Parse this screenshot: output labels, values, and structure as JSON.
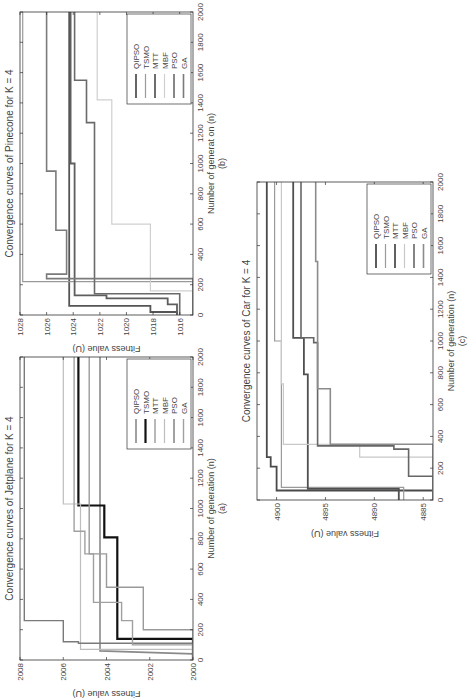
{
  "page": {
    "orientation": "rotated -90deg (landscape figure on portrait page)"
  },
  "chart_data": [
    {
      "id": "jetplane",
      "type": "line",
      "subplot_label": "(a)",
      "title": "Convergence curves of Jetplane for K = 4",
      "xlabel": "Number of generation (n)",
      "ylabel": "Fitness value (U)",
      "xlim": [
        0,
        2000
      ],
      "ylim": [
        2000,
        2008
      ],
      "xticks": [
        0,
        200,
        400,
        600,
        800,
        1000,
        1200,
        1400,
        1600,
        1800,
        2000
      ],
      "yticks": [
        2000,
        2002,
        2004,
        2006,
        2008
      ],
      "legend": [
        "QIPSO",
        "TSMO",
        "MTT",
        "MBF",
        "PSO",
        "GA"
      ],
      "legend_position": "lower right",
      "grid": false,
      "series": [
        {
          "name": "QIPSO",
          "color": "#8a8a8a",
          "width": 1.6,
          "steps": [
            [
              0,
              2000
            ],
            [
              40,
              2000
            ],
            [
              60,
              2004.3
            ],
            [
              2000,
              2004.3
            ]
          ]
        },
        {
          "name": "TSMO",
          "color": "#111111",
          "width": 2.2,
          "steps": [
            [
              0,
              2000
            ],
            [
              140,
              2000
            ],
            [
              140,
              2003.5
            ],
            [
              810,
              2003.5
            ],
            [
              810,
              2004.1
            ],
            [
              1020,
              2004.1
            ],
            [
              1020,
              2005.3
            ],
            [
              2000,
              2005.3
            ]
          ]
        },
        {
          "name": "MTT",
          "color": "#9a9a9a",
          "width": 1.4,
          "steps": [
            [
              0,
              2000
            ],
            [
              200,
              2000
            ],
            [
              200,
              2002.3
            ],
            [
              480,
              2002.3
            ],
            [
              480,
              2004.0
            ],
            [
              700,
              2004.0
            ],
            [
              700,
              2004.8
            ],
            [
              2000,
              2004.8
            ]
          ]
        },
        {
          "name": "MBF",
          "color": "#bdbdbd",
          "width": 1.2,
          "steps": [
            [
              0,
              2000
            ],
            [
              70,
              2000
            ],
            [
              70,
              2005.2
            ],
            [
              1030,
              2005.2
            ],
            [
              1030,
              2006.0
            ],
            [
              2000,
              2006.0
            ]
          ]
        },
        {
          "name": "PSO",
          "color": "#7a7a7a",
          "width": 1.4,
          "steps": [
            [
              0,
              2000
            ],
            [
              110,
              2000
            ],
            [
              110,
              2005.3
            ],
            [
              120,
              2005.3
            ],
            [
              120,
              2006.0
            ],
            [
              260,
              2006.0
            ],
            [
              260,
              2007.8
            ],
            [
              2000,
              2007.8
            ]
          ]
        },
        {
          "name": "GA",
          "color": "#a0a0a0",
          "width": 1.4,
          "steps": [
            [
              0,
              2000
            ],
            [
              100,
              2000
            ],
            [
              100,
              2002.8
            ],
            [
              260,
              2002.8
            ],
            [
              260,
              2003.3
            ],
            [
              380,
              2003.3
            ],
            [
              380,
              2004.6
            ],
            [
              700,
              2004.6
            ],
            [
              700,
              2005.0
            ],
            [
              850,
              2005.0
            ],
            [
              850,
              2005.5
            ],
            [
              2000,
              2005.5
            ]
          ]
        }
      ]
    },
    {
      "id": "pinecone",
      "type": "line",
      "subplot_label": "(b)",
      "title": "Convergence curves of Pinecone for K = 4",
      "xlabel": "Number of generat on (n)",
      "ylabel": "Fitness value (U)",
      "xlim": [
        0,
        2000
      ],
      "ylim": [
        1015,
        1028
      ],
      "xticks": [
        0,
        200,
        400,
        600,
        800,
        1000,
        1200,
        1400,
        1600,
        1800,
        2000
      ],
      "yticks": [
        1016,
        1018,
        1020,
        1022,
        1024,
        1026,
        1028
      ],
      "legend": [
        "QIPSO",
        "TSMO",
        "MTT",
        "MBF",
        "PSO",
        "GA"
      ],
      "legend_position": "lower right",
      "grid": false,
      "series": [
        {
          "name": "QIPSO",
          "color": "#555555",
          "width": 1.8,
          "steps": [
            [
              0,
              1016.2
            ],
            [
              20,
              1016.2
            ],
            [
              20,
              1018.2
            ],
            [
              60,
              1018.2
            ],
            [
              60,
              1024.3
            ],
            [
              2000,
              1024.3
            ]
          ]
        },
        {
          "name": "TSMO",
          "color": "#9a9a9a",
          "width": 1.2,
          "steps": [
            [
              0,
              1015
            ],
            [
              220,
              1015
            ],
            [
              220,
              1027.8
            ],
            [
              2000,
              1027.8
            ]
          ]
        },
        {
          "name": "MTT",
          "color": "#5e5e5e",
          "width": 1.8,
          "steps": [
            [
              0,
              1016.2
            ],
            [
              70,
              1016.2
            ],
            [
              70,
              1016.9
            ],
            [
              110,
              1016.9
            ],
            [
              110,
              1021.5
            ],
            [
              130,
              1021.5
            ],
            [
              130,
              1023.9
            ],
            [
              1000,
              1023.9
            ],
            [
              1000,
              1024.2
            ],
            [
              2000,
              1024.2
            ]
          ]
        },
        {
          "name": "MBF",
          "color": "#cfcfcf",
          "width": 1.2,
          "steps": [
            [
              0,
              1015
            ],
            [
              160,
              1015
            ],
            [
              160,
              1018.2
            ],
            [
              600,
              1018.2
            ],
            [
              600,
              1021.1
            ],
            [
              1420,
              1021.1
            ],
            [
              1420,
              1022.2
            ],
            [
              2000,
              1022.2
            ]
          ]
        },
        {
          "name": "PSO",
          "color": "#6a6a6a",
          "width": 1.6,
          "steps": [
            [
              0,
              1016
            ],
            [
              140,
              1016
            ],
            [
              140,
              1022.4
            ],
            [
              1270,
              1022.4
            ],
            [
              1270,
              1023.0
            ],
            [
              1550,
              1023.0
            ],
            [
              1550,
              1023.9
            ],
            [
              2000,
              1023.9
            ]
          ]
        },
        {
          "name": "GA",
          "color": "#7b7b7b",
          "width": 1.6,
          "steps": [
            [
              0,
              1015
            ],
            [
              240,
              1015
            ],
            [
              240,
              1026.0
            ],
            [
              270,
              1026.0
            ],
            [
              270,
              1024.5
            ],
            [
              560,
              1024.5
            ],
            [
              560,
              1025.3
            ],
            [
              950,
              1025.3
            ],
            [
              950,
              1026.0
            ],
            [
              2000,
              1026.0
            ]
          ]
        }
      ]
    },
    {
      "id": "car",
      "type": "line",
      "subplot_label": "(c)",
      "title": "Convergence curves of Car for K = 4",
      "xlabel": "Number of generation (n)",
      "ylabel": "Fitness value (U)",
      "xlim": [
        0,
        2000
      ],
      "ylim": [
        4884,
        4902
      ],
      "xticks": [
        0,
        200,
        400,
        600,
        800,
        1000,
        1200,
        1400,
        1600,
        1800,
        2000
      ],
      "yticks": [
        4885,
        4890,
        4895,
        4900
      ],
      "legend": [
        "QIPSO",
        "TSMO",
        "MTT",
        "MBF",
        "PSO",
        "GA"
      ],
      "legend_position": "lower right",
      "grid": false,
      "series": [
        {
          "name": "QIPSO",
          "color": "#4a4a4a",
          "width": 1.8,
          "steps": [
            [
              0,
              4884
            ],
            [
              60,
              4884
            ],
            [
              60,
              4900
            ],
            [
              210,
              4900
            ],
            [
              210,
              4900.6
            ],
            [
              270,
              4900.6
            ],
            [
              270,
              4901
            ],
            [
              2000,
              4901
            ]
          ]
        },
        {
          "name": "TSMO",
          "color": "#9a9a9a",
          "width": 1.2,
          "steps": [
            [
              0,
              4887
            ],
            [
              80,
              4887
            ],
            [
              80,
              4899.5
            ],
            [
              1000,
              4899.5
            ],
            [
              1000,
              4900.2
            ],
            [
              2000,
              4900.2
            ]
          ]
        },
        {
          "name": "MTT",
          "color": "#505050",
          "width": 1.8,
          "steps": [
            [
              0,
              4887.5
            ],
            [
              70,
              4887.5
            ],
            [
              70,
              4896.8
            ],
            [
              790,
              4896.8
            ],
            [
              790,
              4897.2
            ],
            [
              1020,
              4897.2
            ],
            [
              1020,
              4898.3
            ],
            [
              2000,
              4898.3
            ]
          ]
        },
        {
          "name": "MBF",
          "color": "#c8c8c8",
          "width": 1.2,
          "steps": [
            [
              0,
              4884
            ],
            [
              270,
              4884
            ],
            [
              270,
              4891.5
            ],
            [
              350,
              4891.5
            ],
            [
              350,
              4899.3
            ],
            [
              730,
              4899.3
            ],
            [
              730,
              4899.5
            ],
            [
              2000,
              4899.5
            ]
          ]
        },
        {
          "name": "PSO",
          "color": "#666666",
          "width": 1.6,
          "steps": [
            [
              0,
              4884
            ],
            [
              150,
              4884
            ],
            [
              150,
              4886.5
            ],
            [
              320,
              4886.5
            ],
            [
              320,
              4888
            ],
            [
              340,
              4888
            ],
            [
              340,
              4895.8
            ],
            [
              990,
              4895.8
            ],
            [
              990,
              4896.2
            ],
            [
              1020,
              4896.2
            ],
            [
              1020,
              4897.5
            ],
            [
              2000,
              4897.5
            ]
          ]
        },
        {
          "name": "GA",
          "color": "#8c8c8c",
          "width": 1.6,
          "steps": [
            [
              0,
              4884
            ],
            [
              350,
              4884
            ],
            [
              350,
              4894.5
            ],
            [
              700,
              4894.5
            ],
            [
              700,
              4895.8
            ],
            [
              1500,
              4895.8
            ],
            [
              1500,
              4896
            ],
            [
              2000,
              4896
            ]
          ]
        }
      ]
    }
  ]
}
